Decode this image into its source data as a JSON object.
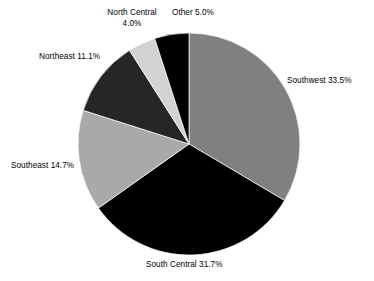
{
  "chart_data": {
    "type": "pie",
    "title": "",
    "subtitle": "",
    "xlabel": "",
    "ylabel": "",
    "legend_position": "none",
    "grid": false,
    "start_angle_deg": 0,
    "direction": "clockwise",
    "units": "percent",
    "total": 100.0,
    "categories": [
      "Southwest",
      "South Central",
      "Southeast",
      "Northeast",
      "North Central",
      "Other"
    ],
    "values": [
      33.5,
      31.7,
      14.7,
      11.1,
      4.0,
      5.0
    ],
    "colors": [
      "#808080",
      "#000000",
      "#a9a9a9",
      "#262626",
      "#d2d2d2",
      "#000000"
    ],
    "slices": [
      {
        "name": "Southwest",
        "value": 33.5,
        "label": "Southwest 33.5%",
        "label_lines": [
          "Southwest 33.5%"
        ],
        "color": "#808080",
        "start_deg": 0.0,
        "end_deg": 120.6
      },
      {
        "name": "South Central",
        "value": 31.7,
        "label": "South Central 31.7%",
        "label_lines": [
          "South Central 31.7%"
        ],
        "color": "#000000",
        "start_deg": 120.6,
        "end_deg": 234.72
      },
      {
        "name": "Southeast",
        "value": 14.7,
        "label": "Southeast 14.7%",
        "label_lines": [
          "Southeast 14.7%"
        ],
        "color": "#a9a9a9",
        "start_deg": 234.72,
        "end_deg": 287.64
      },
      {
        "name": "Northeast",
        "value": 11.1,
        "label": "Northeast 11.1%",
        "label_lines": [
          "Northeast 11.1%"
        ],
        "color": "#262626",
        "start_deg": 287.64,
        "end_deg": 327.6
      },
      {
        "name": "North Central",
        "value": 4.0,
        "label": "North Central 4.0%",
        "label_lines": [
          "North Central",
          "4.0%"
        ],
        "color": "#d2d2d2",
        "start_deg": 327.6,
        "end_deg": 342.0
      },
      {
        "name": "Other",
        "value": 5.0,
        "label": "Other 5.0%",
        "label_lines": [
          "Other 5.0%"
        ],
        "color": "#000000",
        "start_deg": 342.0,
        "end_deg": 360.0
      }
    ]
  },
  "labels": {
    "southwest": "Southwest 33.5%",
    "south_central": "South Central 31.7%",
    "southeast": "Southeast 14.7%",
    "northeast": "Northeast 11.1%",
    "north_central_line1": "North Central",
    "north_central_line2": "4.0%",
    "other": "Other 5.0%"
  },
  "geometry": {
    "center_x": 189,
    "center_y": 144,
    "radius": 111
  }
}
